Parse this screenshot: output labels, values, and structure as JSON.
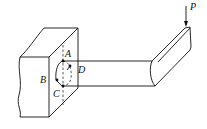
{
  "diagram": {
    "load": {
      "label": "P",
      "direction": "down"
    },
    "points": [
      {
        "id": "A",
        "label": "A"
      },
      {
        "id": "B",
        "label": "B"
      },
      {
        "id": "C",
        "label": "C"
      },
      {
        "id": "D",
        "label": "D"
      }
    ],
    "colors": {
      "line": "#111111",
      "background": "#ffffff"
    }
  }
}
